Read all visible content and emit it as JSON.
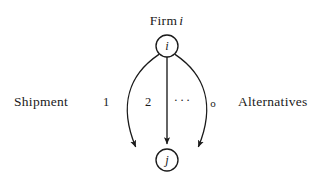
{
  "figure": {
    "type": "directed-multigraph-diagram",
    "background_color": "#ffffff",
    "stroke_color": "#1a1a1a",
    "caption_top": {
      "text": "Firm",
      "variable": "i"
    },
    "side_labels": {
      "left": "Shipment",
      "right": "Alternatives"
    },
    "nodes": [
      {
        "id": "i",
        "label": "i",
        "role": "source",
        "cx": 167,
        "cy": 46,
        "r": 11
      },
      {
        "id": "j",
        "label": "j",
        "role": "sink",
        "cx": 167,
        "cy": 160,
        "r": 11
      }
    ],
    "edges": [
      {
        "id": "edge-1",
        "from": "i",
        "to": "j",
        "label": "1",
        "shape": "curve-left-outer"
      },
      {
        "id": "edge-2",
        "from": "i",
        "to": "j",
        "label": "2",
        "shape": "straight"
      },
      {
        "id": "edge-ellipsis",
        "from": "i",
        "to": "j",
        "label": "···",
        "shape": "omitted"
      },
      {
        "id": "edge-o",
        "from": "i",
        "to": "j",
        "label": "o",
        "shape": "curve-right-outer"
      }
    ],
    "edge_labels": {
      "first": "1",
      "second": "2",
      "ellipsis": "···",
      "last": "o"
    }
  }
}
